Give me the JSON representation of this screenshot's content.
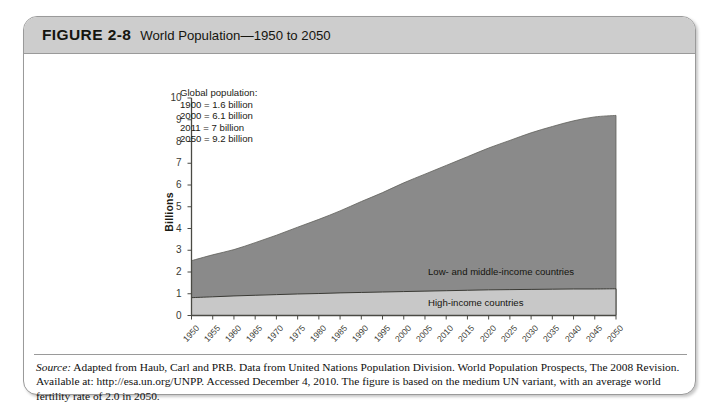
{
  "figure": {
    "label": "FIGURE 2-8",
    "title": "World Population—1950 to 2050"
  },
  "annotation": {
    "heading": "Global population:",
    "lines": [
      "1900 = 1.6 billion",
      "2000 = 6.1 billion",
      "2011 = 7 billion",
      "2050 = 9.2 billion"
    ]
  },
  "source": {
    "prefix": "Source:",
    "text": " Adapted from Haub, Carl and PRB. Data from United Nations Population Division. World Population Prospects, The 2008 Revision. Available at: http://esa.un.org/UNPP. Accessed December 4, 2010. The figure is based on the medium UN variant, with an average world fertility rate of 2.0 in 2050."
  },
  "colors": {
    "low_middle_fill": "#8a8a8a",
    "high_income_fill": "#c8c8c8",
    "header_bar": "#cdcdcd",
    "border": "#9a9a9a",
    "axis": "#4a4a44"
  },
  "chart_data": {
    "type": "area",
    "title": "World Population—1950 to 2050",
    "xlabel": "",
    "ylabel": "Billions",
    "ylim": [
      0,
      10
    ],
    "xlim": [
      "1950",
      "2050"
    ],
    "grid": false,
    "legend": "in-plot labels",
    "stacked": true,
    "yticks": [
      0,
      1,
      2,
      3,
      4,
      5,
      6,
      7,
      8,
      9,
      10
    ],
    "categories": [
      "1950",
      "1955",
      "1960",
      "1965",
      "1970",
      "1975",
      "1980",
      "1985",
      "1990",
      "1995",
      "2000",
      "2005",
      "2010",
      "2015",
      "2020",
      "2025",
      "2030",
      "2035",
      "2040",
      "2045",
      "2050"
    ],
    "series": [
      {
        "name": "High-income countries",
        "values": [
          0.82,
          0.86,
          0.9,
          0.93,
          0.96,
          0.99,
          1.01,
          1.04,
          1.06,
          1.08,
          1.1,
          1.12,
          1.14,
          1.16,
          1.18,
          1.19,
          1.2,
          1.21,
          1.22,
          1.22,
          1.23
        ]
      },
      {
        "name": "Low- and middle-income countries",
        "values": [
          1.7,
          1.93,
          2.13,
          2.42,
          2.73,
          3.07,
          3.41,
          3.77,
          4.18,
          4.57,
          5.0,
          5.38,
          5.76,
          6.14,
          6.52,
          6.86,
          7.2,
          7.48,
          7.73,
          7.91,
          7.97
        ]
      }
    ],
    "totals": [
      2.52,
      2.79,
      3.03,
      3.35,
      3.69,
      4.06,
      4.42,
      4.81,
      5.24,
      5.65,
      6.1,
      6.5,
      6.9,
      7.3,
      7.7,
      8.05,
      8.4,
      8.69,
      8.95,
      9.13,
      9.2
    ],
    "annotations": [
      "Global population:",
      "1900 = 1.6 billion",
      "2000 = 6.1 billion",
      "2011 = 7 billion",
      "2050 = 9.2 billion"
    ]
  }
}
